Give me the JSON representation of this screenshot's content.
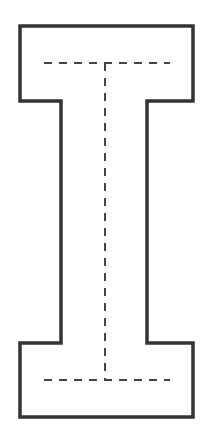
{
  "diagram": {
    "title": "",
    "shape": "letter-I-outline",
    "colors": {
      "background": "#ffffff",
      "outline": "#333333",
      "guides": "#444444"
    },
    "outline": {
      "stroke_width": 3.5,
      "points": [
        [
          20,
          26
        ],
        [
          193,
          26
        ],
        [
          193,
          101
        ],
        [
          147,
          101
        ],
        [
          147,
          343
        ],
        [
          193,
          343
        ],
        [
          193,
          417
        ],
        [
          20,
          417
        ],
        [
          20,
          343
        ],
        [
          61,
          343
        ],
        [
          61,
          101
        ],
        [
          20,
          101
        ]
      ]
    },
    "guides": [
      {
        "name": "top-crossbar-guide",
        "x1": 44,
        "y1": 63,
        "x2": 170,
        "y2": 63
      },
      {
        "name": "stem-guide",
        "x1": 105,
        "y1": 63,
        "x2": 105,
        "y2": 380
      },
      {
        "name": "bottom-crossbar-guide",
        "x1": 44,
        "y1": 380,
        "x2": 170,
        "y2": 380
      }
    ],
    "dash_pattern": "8,7"
  }
}
